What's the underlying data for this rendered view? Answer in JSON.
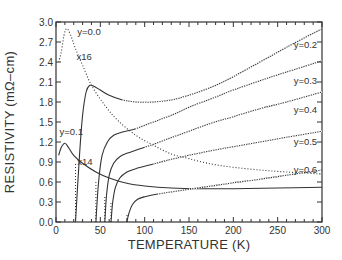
{
  "chart_data": {
    "type": "line",
    "title": "",
    "xlabel": "TEMPERATURE  (K)",
    "ylabel": "RESISTIVITY  (mΩ–cm)",
    "xlim": [
      0,
      300
    ],
    "ylim": [
      0.0,
      3.0
    ],
    "xticks": [
      "0",
      "50",
      "100",
      "150",
      "200",
      "250",
      "300"
    ],
    "yticks": [
      "0.0",
      "0.3",
      "0.6",
      "0.9",
      "1.2",
      "1.5",
      "1.8",
      "2.1",
      "2.4",
      "2.7",
      "3.0"
    ],
    "grid": false,
    "legend": "inline labels",
    "annotations": [
      {
        "text": "y=0.0",
        "x": 24,
        "y": 2.85
      },
      {
        "text": "x16",
        "x": 23,
        "y": 2.48
      },
      {
        "text": "y=0.1",
        "x": 4,
        "y": 1.35
      },
      {
        "text": "x14",
        "x": 24,
        "y": 0.9
      },
      {
        "text": "y=0.2",
        "x": 268,
        "y": 2.65
      },
      {
        "text": "y=0.3",
        "x": 268,
        "y": 2.12
      },
      {
        "text": "y=0.4",
        "x": 268,
        "y": 1.68
      },
      {
        "text": "y=0.5",
        "x": 268,
        "y": 1.2
      },
      {
        "text": "y=0.6",
        "x": 268,
        "y": 0.78
      }
    ],
    "series": [
      {
        "name": "y=0.0 (x16)",
        "style": "dotted",
        "x": [
          3,
          6,
          9,
          12,
          16,
          22,
          30,
          40,
          55,
          70,
          90,
          110,
          130,
          150,
          175,
          200,
          230,
          260,
          300
        ],
        "values": [
          2.4,
          2.55,
          2.8,
          2.9,
          2.82,
          2.6,
          2.35,
          2.05,
          1.75,
          1.52,
          1.3,
          1.15,
          1.02,
          0.95,
          0.87,
          0.82,
          0.78,
          0.75,
          0.72
        ]
      },
      {
        "name": "y=0.1 (x14)",
        "style": "solid",
        "x": [
          3,
          6,
          10,
          14,
          20,
          30,
          45,
          60,
          80,
          100,
          130,
          160,
          200,
          250,
          300
        ],
        "values": [
          1.0,
          1.12,
          1.18,
          1.12,
          1.0,
          0.88,
          0.75,
          0.66,
          0.58,
          0.54,
          0.51,
          0.5,
          0.5,
          0.51,
          0.52
        ]
      },
      {
        "name": "y=0.2",
        "style": "solid/dotted",
        "x": [
          22,
          26,
          30,
          34,
          38,
          42,
          50,
          60,
          75,
          90,
          110,
          130,
          150,
          175,
          200,
          230,
          260,
          300
        ],
        "values": [
          0.0,
          0.9,
          1.6,
          1.95,
          2.05,
          2.04,
          1.98,
          1.9,
          1.83,
          1.8,
          1.8,
          1.83,
          1.9,
          2.02,
          2.18,
          2.4,
          2.62,
          2.9
        ]
      },
      {
        "name": "y=0.3",
        "style": "solid/dotted",
        "x": [
          45,
          48,
          52,
          58,
          65,
          75,
          90,
          110,
          130,
          150,
          175,
          200,
          230,
          260,
          300
        ],
        "values": [
          0.0,
          0.6,
          1.0,
          1.2,
          1.3,
          1.35,
          1.4,
          1.5,
          1.6,
          1.72,
          1.85,
          1.98,
          2.12,
          2.25,
          2.42
        ]
      },
      {
        "name": "y=0.4",
        "style": "solid/dotted",
        "x": [
          55,
          57,
          60,
          65,
          72,
          80,
          100,
          125,
          150,
          175,
          200,
          230,
          260,
          300
        ],
        "values": [
          0.0,
          0.4,
          0.7,
          0.88,
          0.98,
          1.03,
          1.12,
          1.24,
          1.36,
          1.48,
          1.58,
          1.7,
          1.8,
          1.95
        ]
      },
      {
        "name": "y=0.5",
        "style": "solid/dotted",
        "x": [
          62,
          64,
          67,
          72,
          80,
          90,
          110,
          130,
          150,
          175,
          200,
          230,
          260,
          300
        ],
        "values": [
          0.0,
          0.3,
          0.52,
          0.66,
          0.75,
          0.8,
          0.87,
          0.94,
          1.0,
          1.07,
          1.13,
          1.2,
          1.27,
          1.36
        ]
      },
      {
        "name": "y=0.6",
        "style": "solid/dotted",
        "x": [
          80,
          82,
          86,
          92,
          100,
          115,
          130,
          150,
          175,
          200,
          230,
          260,
          300
        ],
        "values": [
          0.0,
          0.12,
          0.26,
          0.34,
          0.38,
          0.42,
          0.45,
          0.49,
          0.54,
          0.59,
          0.64,
          0.7,
          0.78
        ]
      }
    ]
  }
}
